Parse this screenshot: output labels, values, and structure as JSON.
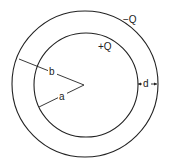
{
  "diagram": {
    "type": "concentric-spherical-capacitor",
    "labels": {
      "outer_charge": "−Q",
      "inner_charge": "+Q",
      "outer_radius": "b",
      "inner_radius": "a",
      "gap": "d"
    },
    "colors": {
      "stroke": "#222222",
      "background": "#ffffff"
    }
  }
}
